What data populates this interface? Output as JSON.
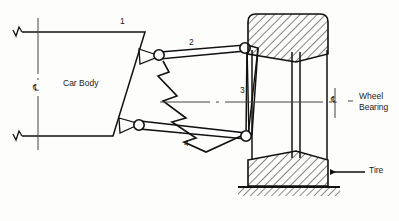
{
  "diagram": {
    "ink_color": "#111111",
    "hatch_color": "#1a1a1a",
    "paper_color": "#fdfdfb"
  },
  "labels": {
    "car_body": "Car Body",
    "link_1": "1",
    "link_2": "2",
    "link_3": "3",
    "link_4": "4",
    "wheel_bearing_line1": "Wheel",
    "wheel_bearing_line2": "Bearing",
    "tire": "Tire",
    "centerline_symbol_left": "℄",
    "centerline_symbol_right": "℄"
  },
  "components": {
    "car_body_name": "car-body",
    "upper_control_arm": "link-2-upper-control-arm",
    "lower_control_arm": "link-4-lower-control-arm",
    "spring": "coil-spring",
    "knuckle": "link-3-steering-knuckle",
    "wheel": "wheel-rim",
    "tire_upper": "tire-upper-section",
    "tire_lower": "tire-lower-section",
    "ground": "ground-hatching",
    "joint_upper_body": "pivot-joint-upper-body",
    "joint_lower_body": "pivot-joint-lower-body",
    "joint_upper_knuckle": "pivot-joint-upper-knuckle",
    "joint_lower_knuckle": "pivot-joint-lower-knuckle",
    "break_symbol_top": "break-symbol-top",
    "break_symbol_bottom": "break-symbol-bottom",
    "leader_wheel_bearing": "leader-line-wheel-bearing",
    "leader_tire": "leader-arrow-tire"
  }
}
